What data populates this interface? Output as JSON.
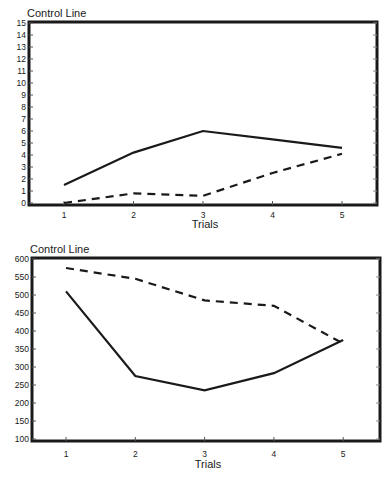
{
  "chart_data": [
    {
      "type": "line",
      "title": "Control Line",
      "xlabel": "Trials",
      "ylabel": "",
      "categories": [
        1,
        2,
        3,
        4,
        5
      ],
      "x_ticks": [
        "1",
        "2",
        "3",
        "4",
        "5"
      ],
      "y_ticks": [
        "0",
        "1",
        "2",
        "3",
        "4",
        "5",
        "6",
        "7",
        "8",
        "9",
        "10",
        "11",
        "12",
        "13",
        "14",
        "15"
      ],
      "ylim": [
        0,
        15
      ],
      "grid": false,
      "legend": null,
      "series": [
        {
          "name": "solid",
          "style": "solid",
          "values": [
            1.5,
            4.2,
            6.0,
            5.3,
            4.6
          ]
        },
        {
          "name": "dashed",
          "style": "dashed",
          "values": [
            0.0,
            0.8,
            0.6,
            2.5,
            4.1
          ]
        }
      ]
    },
    {
      "type": "line",
      "title": "Control Line",
      "xlabel": "Trials",
      "ylabel": "",
      "categories": [
        1,
        2,
        3,
        4,
        5
      ],
      "x_ticks": [
        "1",
        "2",
        "3",
        "4",
        "5"
      ],
      "y_ticks": [
        "100",
        "150",
        "200",
        "250",
        "300",
        "350",
        "400",
        "450",
        "500",
        "550",
        "600"
      ],
      "ylim": [
        100,
        600
      ],
      "grid": false,
      "legend": null,
      "series": [
        {
          "name": "solid",
          "style": "solid",
          "values": [
            510,
            275,
            235,
            283,
            375
          ]
        },
        {
          "name": "dashed",
          "style": "dashed",
          "values": [
            575,
            545,
            485,
            470,
            365
          ]
        }
      ]
    }
  ]
}
